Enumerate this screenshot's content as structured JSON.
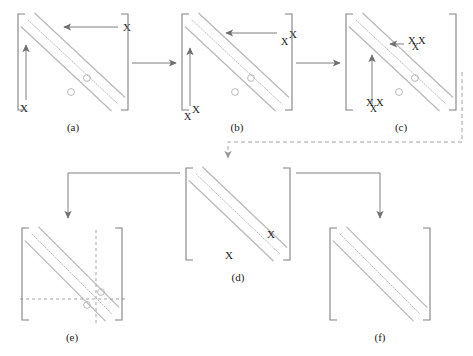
{
  "figure": {
    "title": "",
    "background_color": "#ffffff",
    "band_color": "#b9b9b9",
    "bracket_color": "#808080",
    "arrow_color": "#6f6f6f",
    "dashed_color": "#9a9a9a",
    "text_color": "#1a1a1a",
    "marker_symbol": "X",
    "circle_symbol": "o"
  },
  "panels": [
    {
      "id": "a",
      "caption": "(a)",
      "x": 18,
      "y": 14,
      "w": 110,
      "h": 96,
      "bands": 3,
      "circles": [
        {
          "cx": 87,
          "cy": 78
        },
        {
          "cx": 71,
          "cy": 92
        }
      ],
      "fill_marks": [],
      "arrows": [
        {
          "from": [
            118,
            27
          ],
          "to": [
            64,
            27
          ],
          "label": "X",
          "label_x": 123,
          "label_y": 31,
          "marks": 1
        },
        {
          "from": [
            26,
            100
          ],
          "to": [
            26,
            45
          ],
          "label": "X",
          "label_x": 20,
          "label_y": 112,
          "marks": 1
        }
      ],
      "crosshair": null
    },
    {
      "id": "b",
      "caption": "(b)",
      "x": 182,
      "y": 14,
      "w": 110,
      "h": 96,
      "bands": 3,
      "circles": [
        {
          "cx": 251,
          "cy": 78
        },
        {
          "cx": 235,
          "cy": 92
        }
      ],
      "fill_marks": [],
      "arrows": [
        {
          "from": [
            277,
            33
          ],
          "to": [
            226,
            33
          ],
          "label": "X X",
          "label_x": 281,
          "label_y": 40,
          "marks": 2
        },
        {
          "from": [
            190,
            106
          ],
          "to": [
            190,
            48
          ],
          "label": "X X",
          "label_x": 184,
          "label_y": 115,
          "marks": 2
        }
      ],
      "crosshair": null
    },
    {
      "id": "c",
      "caption": "(c)",
      "x": 346,
      "y": 14,
      "w": 110,
      "h": 96,
      "bands": 3,
      "circles": [
        {
          "cx": 415,
          "cy": 78
        },
        {
          "cx": 399,
          "cy": 92
        }
      ],
      "fill_marks": [],
      "arrows": [
        {
          "from": [
            404,
            44
          ],
          "to": [
            390,
            44
          ],
          "label": "X X X",
          "label_x": 408,
          "label_y": 44,
          "marks": 3
        },
        {
          "from": [
            372,
            104
          ],
          "to": [
            372,
            55
          ],
          "label": "X X X",
          "label_x": 366,
          "label_y": 106,
          "marks": 3
        }
      ],
      "crosshair": null
    },
    {
      "id": "d",
      "caption": "(d)",
      "x": 186,
      "y": 168,
      "w": 104,
      "h": 92,
      "bands": 3,
      "circles": [],
      "fill_marks": [
        {
          "x": 267,
          "y": 238,
          "text": "X"
        },
        {
          "x": 225,
          "y": 259,
          "text": "X"
        }
      ],
      "arrows": [],
      "crosshair": null
    },
    {
      "id": "e",
      "caption": "(e)",
      "x": 22,
      "y": 228,
      "w": 100,
      "h": 92,
      "bands": 3,
      "circles": [
        {
          "cx": 101,
          "cy": 292
        },
        {
          "cx": 87,
          "cy": 305
        }
      ],
      "fill_marks": [],
      "arrows": [],
      "crosshair": {
        "vx": 96,
        "hy": 299
      }
    },
    {
      "id": "f",
      "caption": "(f)",
      "x": 330,
      "y": 228,
      "w": 100,
      "h": 92,
      "bands": 3,
      "circles": [],
      "fill_marks": [],
      "arrows": [],
      "crosshair": null
    }
  ],
  "connectors": [
    {
      "name": "arrow-a-to-b",
      "type": "solid-horizontal",
      "from": [
        132,
        63
      ],
      "to": [
        176,
        63
      ]
    },
    {
      "name": "arrow-b-to-c",
      "type": "solid-horizontal",
      "from": [
        296,
        63
      ],
      "to": [
        340,
        63
      ]
    },
    {
      "name": "dashed-c-to-d",
      "type": "dashed-elbow",
      "points": [
        [
          462,
          72
        ],
        [
          462,
          142
        ],
        [
          228,
          142
        ],
        [
          228,
          158
        ]
      ]
    },
    {
      "name": "arrow-d-to-e",
      "type": "solid-elbow",
      "points": [
        [
          180,
          173
        ],
        [
          68,
          173
        ],
        [
          68,
          218
        ]
      ]
    },
    {
      "name": "arrow-d-to-f",
      "type": "solid-elbow",
      "points": [
        [
          296,
          173
        ],
        [
          380,
          173
        ],
        [
          380,
          218
        ]
      ]
    }
  ]
}
